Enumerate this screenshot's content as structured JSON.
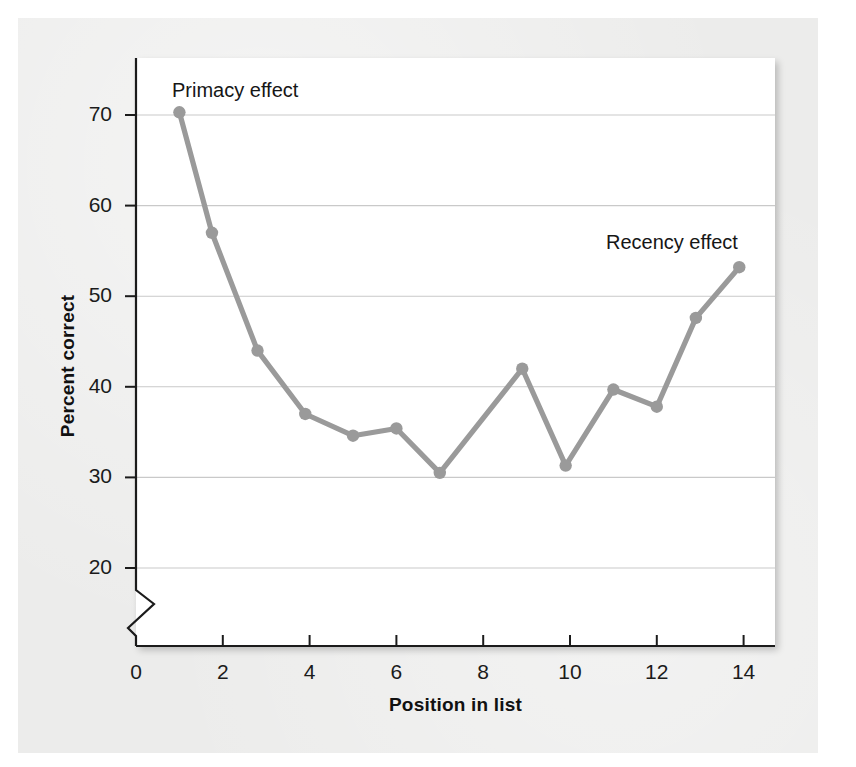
{
  "figure": {
    "background_color": "#ececeb",
    "plot_background_color": "#ffffff",
    "line_color": "#9a9a9a",
    "gridline_color": "#c9c9c9",
    "axis_color": "#1b1b1b"
  },
  "chart_data": {
    "type": "line",
    "title": "",
    "xlabel": "Position in list",
    "ylabel": "Percent correct",
    "xlim": [
      0,
      14.7
    ],
    "ylim": [
      17.5,
      72.5
    ],
    "y_axis_break": true,
    "grid": "horizontal",
    "legend": "none",
    "xticks": [
      0,
      2,
      4,
      6,
      8,
      10,
      12,
      14
    ],
    "xtick_labels": [
      "0",
      "2",
      "4",
      "6",
      "8",
      "10",
      "12",
      "14"
    ],
    "yticks": [
      20,
      30,
      40,
      50,
      60,
      70
    ],
    "ytick_labels": [
      "20",
      "30",
      "40",
      "50",
      "60",
      "70"
    ],
    "series": [
      {
        "name": "Serial position curve",
        "marker": "circle",
        "points": [
          {
            "x": 1.0,
            "y": 70.3
          },
          {
            "x": 1.75,
            "y": 57.0
          },
          {
            "x": 2.8,
            "y": 44.0
          },
          {
            "x": 3.9,
            "y": 37.0
          },
          {
            "x": 5.0,
            "y": 34.6
          },
          {
            "x": 6.0,
            "y": 35.4
          },
          {
            "x": 7.0,
            "y": 30.5
          },
          {
            "x": 8.9,
            "y": 42.0
          },
          {
            "x": 9.9,
            "y": 31.3
          },
          {
            "x": 11.0,
            "y": 39.7
          },
          {
            "x": 12.0,
            "y": 37.8
          },
          {
            "x": 12.9,
            "y": 47.6
          },
          {
            "x": 13.9,
            "y": 53.2
          }
        ]
      }
    ],
    "annotations": [
      {
        "id": "primacy",
        "text": "Primacy effect"
      },
      {
        "id": "recency",
        "text": "Recency effect"
      }
    ]
  }
}
